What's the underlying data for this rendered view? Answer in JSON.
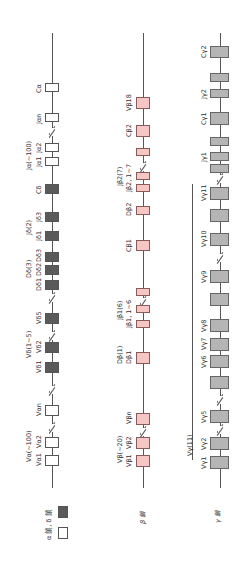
{
  "legend": {
    "items": [
      {
        "label": "α鎖, δ鎖",
        "swatch": "white"
      },
      {
        "label": "",
        "swatch": "dark"
      }
    ],
    "alpha_delta_label": "α 鎖, δ 鎖"
  },
  "chains": [
    {
      "name": "α/δ",
      "title": "",
      "segments": [
        {
          "label": "Cα",
          "type": "white"
        },
        {
          "label": "Jαn",
          "type": "white"
        },
        {
          "label": "Jα2",
          "type": "white"
        },
        {
          "label": "Jα1",
          "type": "white"
        },
        {
          "label": "Cδ",
          "type": "dark"
        },
        {
          "label": "Jδ3",
          "type": "dark"
        },
        {
          "label": "Jδ1",
          "type": "dark"
        },
        {
          "label": "Dδ3",
          "type": "dark"
        },
        {
          "label": "Dδ2",
          "type": "dark"
        },
        {
          "label": "Dδ1",
          "type": "dark"
        },
        {
          "label": "Vδ5",
          "type": "dark"
        },
        {
          "label": "Vδ2",
          "type": "dark"
        },
        {
          "label": "Vδ1",
          "type": "dark"
        },
        {
          "label": "Vαn",
          "type": "white"
        },
        {
          "label": "Vα2",
          "type": "white"
        },
        {
          "label": "Vα1",
          "type": "white"
        }
      ],
      "groups": {
        "ja": "Jα(~100)",
        "jd": "Jδ(2)",
        "dd": "Dδ(3)",
        "vd": "Vδ(1~5)",
        "va": "Vα(~100)"
      }
    },
    {
      "name": "β",
      "title": "β 鎖",
      "segments": [
        {
          "label": "Vβ18",
          "type": "pink"
        },
        {
          "label": "Cβ2",
          "type": "pink"
        },
        {
          "label": "Jβ2, 1~7",
          "type": "pink"
        },
        {
          "label": "Dβ2",
          "type": "pink"
        },
        {
          "label": "Cβ1",
          "type": "pink"
        },
        {
          "label": "Jβ1, 1~6",
          "type": "pink"
        },
        {
          "label": "Dβ1",
          "type": "pink"
        },
        {
          "label": "Vβn",
          "type": "pink"
        },
        {
          "label": "Vβ2",
          "type": "pink"
        },
        {
          "label": "Vβ1",
          "type": "pink"
        }
      ],
      "groups": {
        "jb2": "Jβ2(7)",
        "jb1": "Jβ1(6)",
        "db1": "Dβ(1)",
        "vb": "Vβ(~20)"
      }
    },
    {
      "name": "γ",
      "title": "γ 鎖",
      "segments": [
        {
          "label": "Cγ2",
          "type": "gray"
        },
        {
          "label": "Jγ2",
          "type": "gray"
        },
        {
          "label": "Cγ1",
          "type": "gray"
        },
        {
          "label": "Jγ1",
          "type": "gray"
        },
        {
          "label": "Vγ11",
          "type": "gray"
        },
        {
          "label": "Vγ10",
          "type": "gray"
        },
        {
          "label": "Vγ9",
          "type": "gray"
        },
        {
          "label": "Vγ8",
          "type": "gray"
        },
        {
          "label": "Vγ7",
          "type": "gray"
        },
        {
          "label": "Vγ6",
          "type": "gray"
        },
        {
          "label": "Vγ5",
          "type": "gray"
        },
        {
          "label": "Vγ2",
          "type": "gray"
        },
        {
          "label": "Vγ1",
          "type": "gray"
        }
      ],
      "groups": {
        "vg": "Vγ(11)"
      }
    }
  ],
  "colors": {
    "alpha": "#ffffff",
    "delta": "#5a5a5a",
    "beta": "#f6c6c4",
    "gamma": "#b5b5b5"
  }
}
